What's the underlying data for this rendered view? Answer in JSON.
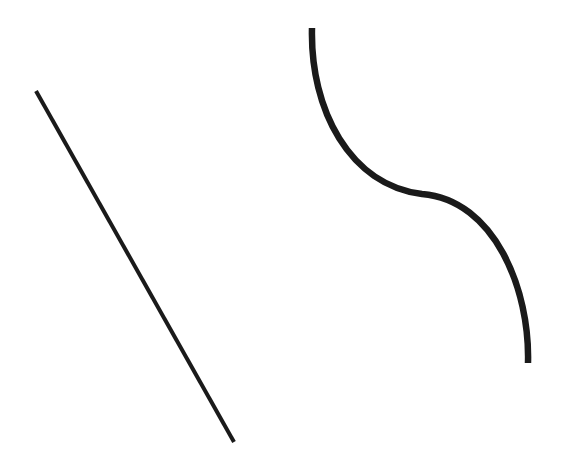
{
  "canvas": {
    "width": 562,
    "height": 465,
    "background": "#ffffff"
  },
  "shapes": [
    {
      "id": "straight-line",
      "type": "line",
      "x1": 36,
      "y1": 91,
      "x2": 234,
      "y2": 442,
      "stroke": "#1a1a1a",
      "stroke_width": 4
    },
    {
      "id": "s-curve",
      "type": "path",
      "d": "M 312 28 C 310 110, 350 185, 422 194 C 495 200, 530 290, 528 363",
      "stroke": "#1a1a1a",
      "stroke_width": 6.5
    }
  ]
}
